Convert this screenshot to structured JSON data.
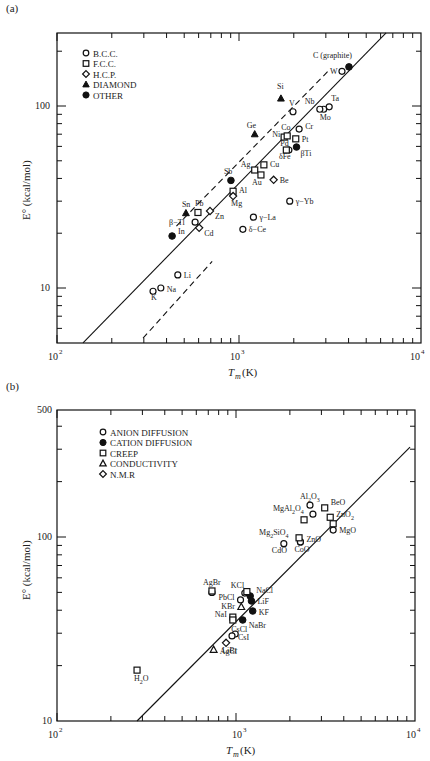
{
  "chart_data": [
    {
      "panel": "(a)",
      "type": "scatter",
      "xscale": "log",
      "yscale": "log",
      "xlabel": "T_m (K)",
      "ylabel": "E° (kcal/mol)",
      "xlim": [
        100,
        10000
      ],
      "ylim": [
        5,
        250
      ],
      "xticks": [
        "10^2",
        "10^3",
        "10^4"
      ],
      "yticks": [
        "10",
        "100"
      ],
      "grid": false,
      "legend_position": "upper left",
      "legend": [
        {
          "marker": "open-circle",
          "label": "B.C.C."
        },
        {
          "marker": "open-square",
          "label": "F.C.C."
        },
        {
          "marker": "open-diamond",
          "label": "H.C.P."
        },
        {
          "marker": "filled-triangle",
          "label": "DIAMOND"
        },
        {
          "marker": "filled-circle",
          "label": "OTHER"
        }
      ],
      "lines": [
        {
          "style": "solid",
          "x": [
            139,
            6430
          ],
          "y": [
            5.0,
            252
          ]
        },
        {
          "style": "dashed",
          "x": [
            453,
            3080
          ],
          "y": [
            21.9,
            155
          ]
        },
        {
          "style": "dashed",
          "x": [
            297,
            712
          ],
          "y": [
            5.3,
            14.0
          ]
        }
      ],
      "series": [
        {
          "name": "B.C.C.",
          "marker": "open-circle",
          "points": [
            {
              "label": "K",
              "x": 337,
              "y": 9.6
            },
            {
              "label": "Na",
              "x": 372,
              "y": 10.0
            },
            {
              "label": "Li",
              "x": 461,
              "y": 11.8
            },
            {
              "label": "β−Tl",
              "x": 574,
              "y": 23.0
            },
            {
              "label": "γ−La",
              "x": 1200,
              "y": 24.5
            },
            {
              "label": "δ−Ce",
              "x": 1050,
              "y": 21.0
            },
            {
              "label": "γ−Yb",
              "x": 1900,
              "y": 30.0
            },
            {
              "label": "Cr",
              "x": 2140,
              "y": 74.7
            },
            {
              "label": "V",
              "x": 1980,
              "y": 93.0
            },
            {
              "label": "Ta",
              "x": 3130,
              "y": 99.0
            },
            {
              "label": "W",
              "x": 3680,
              "y": 155.0
            },
            {
              "label": "Mo",
              "x": 2920,
              "y": 96.0
            },
            {
              "label": "Nb",
              "x": 2780,
              "y": 96.0
            },
            {
              "label": "δFe",
              "x": 1880,
              "y": 57.3
            }
          ]
        },
        {
          "name": "F.C.C.",
          "marker": "open-square",
          "points": [
            {
              "label": "Pb",
              "x": 595,
              "y": 26.0
            },
            {
              "label": "Al",
              "x": 928,
              "y": 34.0
            },
            {
              "label": "Ag",
              "x": 1220,
              "y": 44.5
            },
            {
              "label": "Au",
              "x": 1320,
              "y": 41.8
            },
            {
              "label": "Cu",
              "x": 1370,
              "y": 47.5
            },
            {
              "label": "Ni",
              "x": 1770,
              "y": 67.5
            },
            {
              "label": "Co",
              "x": 1840,
              "y": 68.5
            },
            {
              "label": "Pd",
              "x": 1820,
              "y": 57.3
            },
            {
              "label": "Pt",
              "x": 2050,
              "y": 66.0
            }
          ]
        },
        {
          "name": "H.C.P.",
          "marker": "open-diamond",
          "points": [
            {
              "label": "Zn",
              "x": 693,
              "y": 26.5
            },
            {
              "label": "Cd",
              "x": 604,
              "y": 21.4
            },
            {
              "label": "Mg",
              "x": 928,
              "y": 32.0
            },
            {
              "label": "Be",
              "x": 1550,
              "y": 39.3
            }
          ]
        },
        {
          "name": "DIAMOND",
          "marker": "filled-triangle",
          "points": [
            {
              "label": "Sn",
              "x": 511,
              "y": 25.8
            },
            {
              "label": "Ge",
              "x": 1220,
              "y": 70.0
            },
            {
              "label": "Si",
              "x": 1700,
              "y": 110.0
            }
          ]
        },
        {
          "name": "OTHER",
          "marker": "filled-circle",
          "points": [
            {
              "label": "In",
              "x": 429,
              "y": 19.3
            },
            {
              "label": "Sb",
              "x": 903,
              "y": 39.0
            },
            {
              "label": "βTi",
              "x": 2070,
              "y": 59.5
            },
            {
              "label": "C (graphite)",
              "x": 4020,
              "y": 164.0
            }
          ]
        }
      ]
    },
    {
      "panel": "(b)",
      "type": "scatter",
      "xscale": "log",
      "yscale": "log",
      "xlabel": "T_m (K)",
      "ylabel": "E° (kcal/mol)",
      "xlim": [
        100,
        10000
      ],
      "ylim": [
        10,
        500
      ],
      "xticks": [
        "10^2",
        "10^3",
        "10^4"
      ],
      "yticks": [
        "10",
        "100",
        "500"
      ],
      "grid": false,
      "legend_position": "upper left",
      "legend": [
        {
          "marker": "open-circle",
          "label": "ANION DIFFUSION"
        },
        {
          "marker": "filled-circle",
          "label": "CATION DIFFUSION"
        },
        {
          "marker": "open-square",
          "label": "CREEP"
        },
        {
          "marker": "open-triangle",
          "label": "CONDUCTIVITY"
        },
        {
          "marker": "open-diamond",
          "label": "N.M.R"
        }
      ],
      "lines": [
        {
          "style": "solid",
          "x": [
            280,
            9380
          ],
          "y": [
            10,
            308
          ]
        }
      ],
      "series": [
        {
          "name": "ANION DIFFUSION",
          "marker": "open-circle",
          "points": [
            {
              "label": "Al2O3",
              "x": 2590,
              "y": 149
            },
            {
              "label": "MgAl2O4",
              "x": 2690,
              "y": 133
            },
            {
              "label": "MgO",
              "x": 3490,
              "y": 109
            },
            {
              "label": "ZnO",
              "x": 2290,
              "y": 94
            },
            {
              "label": "CoO",
              "x": 2290,
              "y": 94
            },
            {
              "label": "CdO",
              "x": 1850,
              "y": 92
            },
            {
              "label": "KCl",
              "x": 1120,
              "y": 49.6
            },
            {
              "label": "PbCl",
              "x": 1060,
              "y": 45.5
            },
            {
              "label": "CsCl",
              "x": 990,
              "y": 29.7
            },
            {
              "label": "CsI",
              "x": 950,
              "y": 29.0
            },
            {
              "label": "AgBr",
              "x": 734,
              "y": 50.0
            }
          ]
        },
        {
          "name": "CATION DIFFUSION",
          "marker": "filled-circle",
          "points": [
            {
              "label": "NaCl",
              "x": 1200,
              "y": 47.8
            },
            {
              "label": "LiF",
              "x": 1220,
              "y": 44.9
            },
            {
              "label": "KF",
              "x": 1240,
              "y": 39.6
            },
            {
              "label": "NaBr",
              "x": 1090,
              "y": 35.4
            }
          ]
        },
        {
          "name": "CREEP",
          "marker": "open-square",
          "points": [
            {
              "label": "BeO",
              "x": 3130,
              "y": 144
            },
            {
              "label": "MgAl2O4",
              "x": 2400,
              "y": 124
            },
            {
              "label": "ZnO2",
              "x": 3360,
              "y": 128
            },
            {
              "label": "ZnO2",
              "x": 3490,
              "y": 118
            },
            {
              "label": "Mg2SiO4",
              "x": 2250,
              "y": 99
            },
            {
              "label": "AgBr",
              "x": 734,
              "y": 50.9
            },
            {
              "label": "KCl",
              "x": 1150,
              "y": 50.5
            },
            {
              "label": "NaI",
              "x": 960,
              "y": 36.7
            },
            {
              "label": "CsCl",
              "x": 960,
              "y": 35.4
            },
            {
              "label": "H2O",
              "x": 280,
              "y": 18.9
            }
          ]
        },
        {
          "name": "CONDUCTIVITY",
          "marker": "open-triangle",
          "points": [
            {
              "label": "KBr",
              "x": 1070,
              "y": 41.7
            },
            {
              "label": "AgCl",
              "x": 750,
              "y": 24.4
            }
          ]
        },
        {
          "name": "N.M.R",
          "marker": "open-diamond",
          "points": [
            {
              "label": "LiBr",
              "x": 880,
              "y": 26.6
            }
          ]
        }
      ]
    }
  ],
  "labels": {
    "panel_a": "(a)",
    "panel_b": "(b)",
    "xlabel": "T",
    "xlabel_sub": "m",
    "xlabel_unit": " (K)",
    "ylabel": "E° (kcal/mol)",
    "tick_1e2": "10",
    "tick_1e3": "10",
    "tick_1e4": "10",
    "exp_2": "2",
    "exp_3": "3",
    "exp_4": "4",
    "y10": "10",
    "y100": "100",
    "y500": "500"
  }
}
